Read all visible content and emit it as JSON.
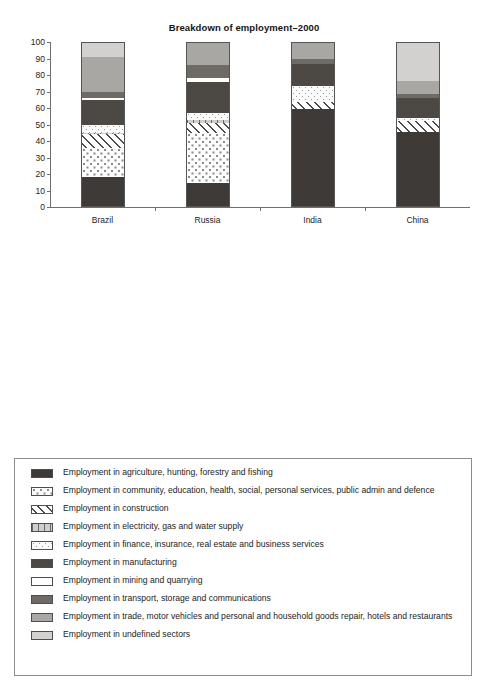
{
  "chart_data": [
    {
      "type": "bar",
      "subtype": "stacked-100",
      "title": "Breakdown of employment–2000",
      "xlabel": "",
      "ylabel": "",
      "ylim": [
        0,
        100
      ],
      "yticks": [
        0,
        10,
        20,
        30,
        40,
        50,
        60,
        70,
        80,
        90,
        100
      ],
      "ytick_labels": [
        "0",
        "10",
        "20",
        "30",
        "40",
        "50",
        "60",
        "70",
        "80",
        "90",
        "100"
      ],
      "grid": false,
      "legend_position": "below",
      "categories": [
        "Brazil",
        "Russia",
        "India",
        "China"
      ],
      "series": [
        {
          "name": "Employment in agriculture, hunting, forestry and fishing",
          "key": "agriculture",
          "values": [
            18.0,
            14.5,
            59.5,
            45.5
          ]
        },
        {
          "name": "Employment in community, education, health, social, personal services, public admin and defence",
          "key": "community",
          "values": [
            18.0,
            30.5,
            0.0,
            0.0
          ]
        },
        {
          "name": "Employment in construction",
          "key": "construction",
          "values": [
            8.0,
            6.0,
            4.0,
            6.5
          ]
        },
        {
          "name": "Employment in electricity, gas and water supply",
          "key": "electricity",
          "values": [
            1.0,
            1.5,
            0.0,
            0.0
          ]
        },
        {
          "name": "Employment in finance, insurance, real estate and business services",
          "key": "finance",
          "values": [
            5.0,
            4.5,
            10.0,
            2.0
          ]
        },
        {
          "name": "Employment in manufacturing",
          "key": "manufacturing",
          "values": [
            15.0,
            19.0,
            13.0,
            12.0
          ]
        },
        {
          "name": "Employment in mining and quarrying",
          "key": "mining",
          "values": [
            1.0,
            2.0,
            0.0,
            0.0
          ]
        },
        {
          "name": "Employment in transport, storage and communications",
          "key": "transport",
          "values": [
            4.0,
            8.0,
            3.5,
            2.5
          ]
        },
        {
          "name": "Employment in trade, motor vehicles and personal and household goods repair, hotels and restaurants",
          "key": "trade",
          "values": [
            21.0,
            14.0,
            10.0,
            8.0
          ]
        },
        {
          "name": "Employment in undefined sectors",
          "key": "undefined",
          "values": [
            9.0,
            0.0,
            0.0,
            23.5
          ]
        }
      ]
    },
    {
      "type": "bar",
      "subtype": "stacked-100",
      "title": "Breakdown of employment–2010",
      "xlabel": "",
      "ylabel": "",
      "ylim": [
        0,
        100
      ],
      "yticks": [
        0,
        10,
        20,
        30,
        40,
        50,
        60,
        70,
        80,
        90,
        100
      ],
      "ytick_labels": [
        "-",
        "10",
        "20",
        "30",
        "40",
        "50",
        "60",
        "70",
        "80",
        "90",
        "100"
      ],
      "grid": false,
      "legend_position": "below",
      "categories": [
        "Brazil",
        "Russia",
        "India",
        "China"
      ],
      "series": [
        {
          "name": "Employment in agriculture, hunting, forestry and fishing",
          "key": "agriculture",
          "values": [
            17.5,
            8.5,
            53.5,
            36.0
          ]
        },
        {
          "name": "Employment in community, education, health, social, personal services, public admin and defence",
          "key": "community",
          "values": [
            18.5,
            27.5,
            0.0,
            0.0
          ]
        },
        {
          "name": "Employment in construction",
          "key": "construction",
          "values": [
            6.5,
            8.0,
            11.5,
            7.0
          ]
        },
        {
          "name": "Employment in electricity, gas and water supply",
          "key": "electricity",
          "values": [
            1.0,
            1.5,
            0.0,
            0.0
          ]
        },
        {
          "name": "Employment in finance, insurance, real estate and business services",
          "key": "finance",
          "values": [
            7.0,
            1.5,
            7.0,
            6.5
          ]
        },
        {
          "name": "Employment in manufacturing",
          "key": "manufacturing",
          "values": [
            15.0,
            24.5,
            12.0,
            15.5
          ]
        },
        {
          "name": "Employment in mining and quarrying",
          "key": "mining",
          "values": [
            1.0,
            1.5,
            0.0,
            1.0
          ]
        },
        {
          "name": "Employment in transport, storage and communications",
          "key": "transport",
          "values": [
            4.5,
            9.5,
            5.5,
            2.0
          ]
        },
        {
          "name": "Employment in trade, motor vehicles and personal and household goods repair, hotels and restaurants",
          "key": "trade",
          "values": [
            21.5,
            17.5,
            10.5,
            5.0
          ]
        },
        {
          "name": "Employment in undefined sectors",
          "key": "undefined",
          "values": [
            7.5,
            0.0,
            0.0,
            27.0
          ]
        }
      ]
    }
  ],
  "legend": {
    "items": [
      {
        "key": "agriculture",
        "label": "Employment in agriculture, hunting, forestry and fishing"
      },
      {
        "key": "community",
        "label": "Employment in community, education, health, social, personal services, public admin and defence"
      },
      {
        "key": "construction",
        "label": "Employment in construction"
      },
      {
        "key": "electricity",
        "label": "Employment in electricity, gas and water supply"
      },
      {
        "key": "finance",
        "label": "Employment in finance, insurance, real estate and business services"
      },
      {
        "key": "manufacturing",
        "label": "Employment in manufacturing"
      },
      {
        "key": "mining",
        "label": "Employment in mining and quarrying"
      },
      {
        "key": "transport",
        "label": "Employment in transport, storage and communications"
      },
      {
        "key": "trade",
        "label": "Employment in trade, motor vehicles and personal and household goods repair, hotels and restaurants"
      },
      {
        "key": "undefined",
        "label": "Employment in undefined sectors"
      }
    ]
  },
  "colors": {
    "agriculture": "#3e3a37",
    "manufacturing": "#4c4945",
    "transport": "#6e6b67",
    "trade": "#a9a7a4",
    "undefined": "#d2d1cf",
    "mining": "#ffffff",
    "electricity": "#cfcecc",
    "community": "#fdfdfd",
    "finance": "#fafafa",
    "construction": "#ffffff",
    "axis": "#6f6f6f",
    "text": "#1c1c1c"
  }
}
